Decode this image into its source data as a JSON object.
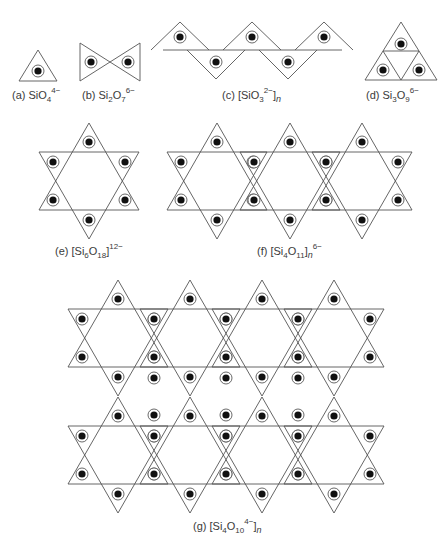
{
  "figure": {
    "stroke_color": "#555555",
    "dot_color": "#111111",
    "panels": [
      {
        "id": "a",
        "letter": "(a)",
        "formula": [
          [
            "t",
            "SiO"
          ],
          [
            "sub",
            "4"
          ],
          [
            "sup",
            "4−"
          ]
        ],
        "label_pos": [
          12,
          89
        ]
      },
      {
        "id": "b",
        "letter": "(b)",
        "formula": [
          [
            "t",
            "Si"
          ],
          [
            "sub",
            "2"
          ],
          [
            "t",
            "O"
          ],
          [
            "sub",
            "7"
          ],
          [
            "sup",
            "6−"
          ]
        ],
        "label_pos": [
          82,
          89
        ]
      },
      {
        "id": "c",
        "letter": "(c)",
        "formula": [
          [
            "t",
            "[SiO"
          ],
          [
            "sub",
            "3"
          ],
          [
            "sup",
            "2−"
          ],
          [
            "t",
            "]"
          ],
          [
            "i",
            "n"
          ]
        ],
        "label_pos": [
          222,
          89
        ]
      },
      {
        "id": "d",
        "letter": "(d)",
        "formula": [
          [
            "t",
            "Si"
          ],
          [
            "sub",
            "3"
          ],
          [
            "t",
            "O"
          ],
          [
            "sub",
            "9"
          ],
          [
            "sup",
            "6−"
          ]
        ],
        "label_pos": [
          366,
          89
        ]
      },
      {
        "id": "e",
        "letter": "(e)",
        "formula": [
          [
            "t",
            "[Si"
          ],
          [
            "sub",
            "6"
          ],
          [
            "t",
            "O"
          ],
          [
            "sub",
            "18"
          ],
          [
            "t",
            "]"
          ],
          [
            "sup",
            "12−"
          ]
        ],
        "label_pos": [
          55,
          245
        ]
      },
      {
        "id": "f",
        "letter": "(f)",
        "formula": [
          [
            "t",
            "[Si"
          ],
          [
            "sub",
            "4"
          ],
          [
            "t",
            "O"
          ],
          [
            "sub",
            "11"
          ],
          [
            "t",
            "]"
          ],
          [
            "i",
            "n"
          ],
          [
            "sup",
            "6−"
          ]
        ],
        "label_pos": [
          257,
          245
        ]
      },
      {
        "id": "g",
        "letter": "(g)",
        "formula": [
          [
            "t",
            "[Si"
          ],
          [
            "sub",
            "4"
          ],
          [
            "t",
            "O"
          ],
          [
            "sub",
            "10"
          ],
          [
            "sup",
            "4−"
          ],
          [
            "t",
            "]"
          ],
          [
            "i",
            "n"
          ]
        ],
        "label_pos": [
          193,
          520
        ]
      }
    ],
    "shapes": {
      "a": {
        "polys": [
          [
            [
              38,
              50
            ],
            [
              57,
              81
            ],
            [
              19,
              81
            ]
          ]
        ],
        "dots": [
          [
            38,
            71
          ]
        ]
      },
      "b": {
        "polys": [
          [
            [
              80,
              43
            ],
            [
              140,
              81
            ],
            [
              140,
              43
            ],
            [
              80,
              81
            ]
          ]
        ],
        "dots": [
          [
            91,
            62
          ],
          [
            128,
            62
          ]
        ]
      },
      "c": {
        "polys": [
          [
            [
              163,
              52
            ],
            [
              177,
              29
            ],
            [
              227,
              110
            ]
          ]
        ],
        "dots": []
      },
      "d": {
        "polys": [],
        "dots": []
      }
    },
    "chain_c": {
      "tops": [
        180,
        252,
        324
      ],
      "bottoms": [
        216,
        288
      ],
      "y_top": 22,
      "y_mid": 50,
      "y_bot": 79,
      "hw": 17,
      "x_left": 163,
      "x_right": 342
    },
    "trimer_d": {
      "apex": [
        401,
        22
      ],
      "base_y": 80,
      "hw": 36
    },
    "stars_e": [
      [
        89,
        181
      ]
    ],
    "stars_f": [
      [
        217,
        181
      ],
      [
        290,
        181
      ],
      [
        362,
        181
      ]
    ],
    "stars_g": [
      [
        118,
        338
      ],
      [
        190,
        338
      ],
      [
        262,
        338
      ],
      [
        334,
        338
      ],
      [
        118,
        455
      ],
      [
        190,
        455
      ],
      [
        262,
        455
      ],
      [
        334,
        455
      ]
    ],
    "star_geom": {
      "h_tip": 29,
      "hw_tip": 17,
      "hw_big": 50
    }
  }
}
